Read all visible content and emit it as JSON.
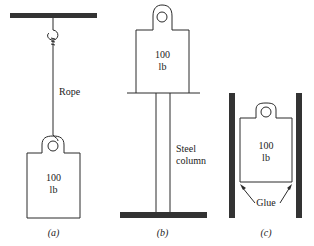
{
  "colors": {
    "ink": "#2a2a2a",
    "fill": "#333333",
    "background": "#ffffff"
  },
  "panels": [
    {
      "id": "a",
      "caption": "(a)",
      "support_label": "Rope",
      "weight": {
        "value": "100",
        "unit": "lb"
      }
    },
    {
      "id": "b",
      "caption": "(b)",
      "support_label_line1": "Steel",
      "support_label_line2": "column",
      "weight": {
        "value": "100",
        "unit": "lb"
      }
    },
    {
      "id": "c",
      "caption": "(c)",
      "support_label": "Glue",
      "weight": {
        "value": "100",
        "unit": "lb"
      }
    }
  ]
}
